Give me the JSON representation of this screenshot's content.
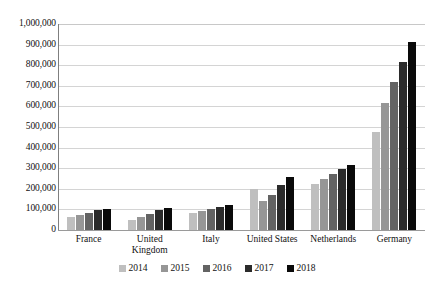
{
  "chart_data": {
    "type": "bar",
    "title": "",
    "subtitle": "",
    "xlabel": "",
    "ylabel": "",
    "ylim": [
      0,
      1000000
    ],
    "grid": true,
    "legend_position": "bottom",
    "categories": [
      "France",
      "United Kingdom",
      "Italy",
      "United States",
      "Netherlands",
      "Germany"
    ],
    "category_lines": [
      [
        "France"
      ],
      [
        "United",
        "Kingdom"
      ],
      [
        "Italy"
      ],
      [
        "United States"
      ],
      [
        "Netherlands"
      ],
      [
        "Germany"
      ]
    ],
    "ytick_labels": [
      "1,000,000",
      "900,000",
      "800,000",
      "700,000",
      "600,000",
      "500,000",
      "400,000",
      "300,000",
      "200,000",
      "100,000",
      "0"
    ],
    "ytick_values": [
      1000000,
      900000,
      800000,
      700000,
      600000,
      500000,
      400000,
      300000,
      200000,
      100000,
      0
    ],
    "series": [
      {
        "name": "2014",
        "color": "#BFBFBF",
        "values": [
          65000,
          50000,
          85000,
          200000,
          225000,
          475000
        ]
      },
      {
        "name": "2015",
        "color": "#969696",
        "values": [
          75000,
          62000,
          92000,
          140000,
          250000,
          615000
        ]
      },
      {
        "name": "2016",
        "color": "#636363",
        "values": [
          85000,
          78000,
          100000,
          170000,
          272000,
          720000
        ]
      },
      {
        "name": "2017",
        "color": "#2B2B2B",
        "values": [
          95000,
          95000,
          110000,
          220000,
          295000,
          815000
        ]
      },
      {
        "name": "2018",
        "color": "#0A0A0A",
        "values": [
          102000,
          105000,
          122000,
          255000,
          315000,
          915000
        ]
      }
    ]
  }
}
